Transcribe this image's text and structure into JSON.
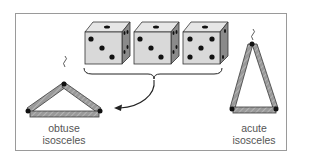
{
  "figure": {
    "dice": [
      {
        "top": 1,
        "front": 3,
        "side": 4
      },
      {
        "top": 1,
        "front": 3,
        "side": 4
      },
      {
        "top": 1,
        "front": 5,
        "side": 2
      }
    ],
    "triangles": [
      {
        "id": "obtuse",
        "label_line1": "obtuse",
        "label_line2": "isosceles"
      },
      {
        "id": "acute",
        "label_line1": "acute",
        "label_line2": "isosceles"
      }
    ],
    "colors": {
      "die_front": "#d9d9d9",
      "die_top": "#e6e6e6",
      "die_side": "#8a8a8a",
      "pip": "#111111",
      "stick": "#9a9a9a",
      "stick_edge": "#3a3a3a",
      "frame": "#9a9a9a"
    }
  }
}
